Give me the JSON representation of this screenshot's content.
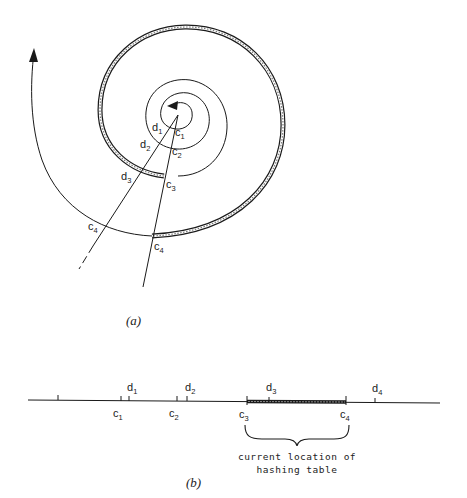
{
  "figure": {
    "part_a": {
      "caption": "(a)",
      "labels": {
        "d1": {
          "base": "d",
          "sub": "1"
        },
        "d2": {
          "base": "d",
          "sub": "2"
        },
        "d3": {
          "base": "d",
          "sub": "3"
        },
        "c1": {
          "base": "c",
          "sub": "1"
        },
        "c2": {
          "base": "c",
          "sub": "2"
        },
        "c3": {
          "base": "c",
          "sub": "3"
        },
        "c4_left": {
          "base": "c",
          "sub": "4"
        },
        "c4_right": {
          "base": "c",
          "sub": "4"
        }
      }
    },
    "part_b": {
      "caption": "(b)",
      "ticks_above": {
        "d1": {
          "base": "d",
          "sub": "1"
        },
        "d2": {
          "base": "d",
          "sub": "2"
        },
        "d3": {
          "base": "d",
          "sub": "3"
        },
        "d4": {
          "base": "d",
          "sub": "4"
        }
      },
      "ticks_below": {
        "c1": {
          "base": "c",
          "sub": "1"
        },
        "c2": {
          "base": "c",
          "sub": "2"
        },
        "c3": {
          "base": "c",
          "sub": "3"
        },
        "c4": {
          "base": "c",
          "sub": "4"
        }
      },
      "brace_note_line1": "current  location  of",
      "brace_note_line2": "hashing  table"
    },
    "colors": {
      "ink": "#1a1a1a",
      "hatch": "#555555",
      "background": "#ffffff"
    }
  }
}
